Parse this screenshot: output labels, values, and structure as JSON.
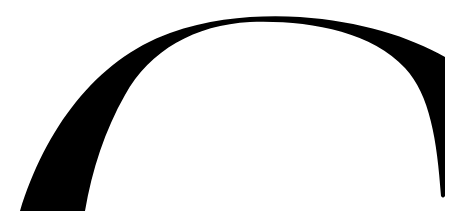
{
  "image": {
    "description": "Black arch / hook-like silhouette on white background",
    "background_color": "#ffffff",
    "shape_color": "#000000"
  }
}
